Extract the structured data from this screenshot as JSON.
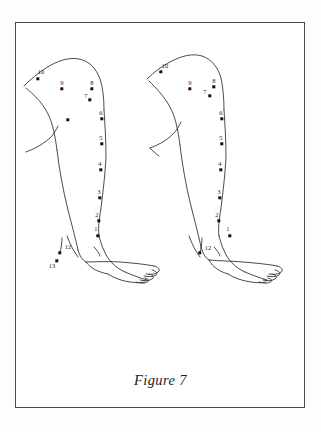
{
  "figure": {
    "caption": "Figure 7",
    "frame_color": "#4a4a4a",
    "line_color": "#2b2b2b",
    "dot_color": "#111111",
    "background": "#ffffff"
  },
  "diagram": {
    "type": "anatomical-line-drawing",
    "panels": [
      {
        "id": "left-leg",
        "name": "Left leg lateral view",
        "points": [
          {
            "label": "1",
            "x": 98,
            "y": 236,
            "label_x": 96,
            "label_y": 228
          },
          {
            "label": "2",
            "x": 99,
            "y": 221,
            "label_x": 97,
            "label_y": 214
          },
          {
            "label": "3",
            "x": 100,
            "y": 198,
            "label_x": 99,
            "label_y": 191
          },
          {
            "label": "4",
            "x": 101,
            "y": 170,
            "label_x": 100,
            "label_y": 163
          },
          {
            "label": "5",
            "x": 102,
            "y": 144,
            "label_x": 101,
            "label_y": 137
          },
          {
            "label": "6",
            "x": 102,
            "y": 119,
            "label_x": 101,
            "label_y": 112
          },
          {
            "label": "7",
            "x": 90,
            "y": 100,
            "label_x": 86,
            "label_y": 95
          },
          {
            "label": "8",
            "x": 92,
            "y": 89,
            "label_x": 92,
            "label_y": 82
          },
          {
            "label": "9",
            "x": 62,
            "y": 89,
            "label_x": 62,
            "label_y": 82
          },
          {
            "label": "10",
            "x": 38,
            "y": 79,
            "label_x": 41,
            "label_y": 71
          },
          {
            "label": "12",
            "x": 60,
            "y": 253,
            "label_x": 68,
            "label_y": 246
          },
          {
            "label": "13",
            "x": 57,
            "y": 261,
            "label_x": 52,
            "label_y": 265
          },
          {
            "label": "",
            "x": 68,
            "y": 120,
            "label_x": 68,
            "label_y": 120
          }
        ]
      },
      {
        "id": "right-leg",
        "name": "Right leg lateral view",
        "points": [
          {
            "label": "1",
            "x": 230,
            "y": 236,
            "label_x": 228,
            "label_y": 228
          },
          {
            "label": "2",
            "x": 219,
            "y": 221,
            "label_x": 217,
            "label_y": 214
          },
          {
            "label": "3",
            "x": 220,
            "y": 198,
            "label_x": 219,
            "label_y": 191
          },
          {
            "label": "4",
            "x": 221,
            "y": 170,
            "label_x": 220,
            "label_y": 163
          },
          {
            "label": "5",
            "x": 222,
            "y": 144,
            "label_x": 221,
            "label_y": 137
          },
          {
            "label": "6",
            "x": 222,
            "y": 119,
            "label_x": 221,
            "label_y": 112
          },
          {
            "label": "7",
            "x": 210,
            "y": 96,
            "label_x": 205,
            "label_y": 91
          },
          {
            "label": "8",
            "x": 214,
            "y": 87,
            "label_x": 214,
            "label_y": 80
          },
          {
            "label": "9",
            "x": 190,
            "y": 89,
            "label_x": 190,
            "label_y": 82
          },
          {
            "label": "10",
            "x": 161,
            "y": 72,
            "label_x": 165,
            "label_y": 65
          },
          {
            "label": "12",
            "x": 200,
            "y": 253,
            "label_x": 208,
            "label_y": 247
          }
        ]
      }
    ]
  }
}
